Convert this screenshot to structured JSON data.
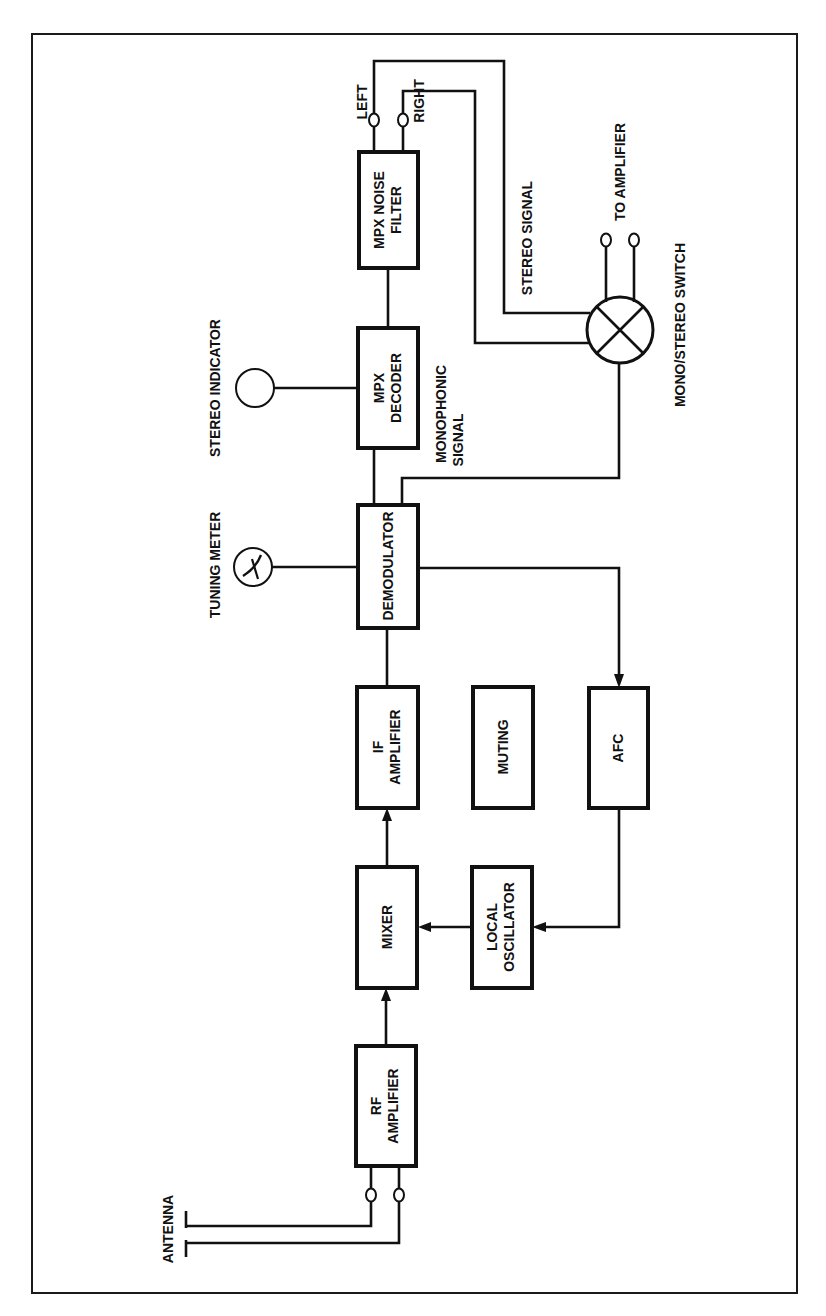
{
  "diagram": {
    "blocks": {
      "rf_amplifier": {
        "line1": "RF",
        "line2": "AMPLIFIER"
      },
      "mixer": {
        "line1": "MIXER"
      },
      "local_oscillator": {
        "line1": "LOCAL",
        "line2": "OSCILLATOR"
      },
      "if_amplifier": {
        "line1": "IF",
        "line2": "AMPLIFIER"
      },
      "muting": {
        "line1": "MUTING"
      },
      "afc": {
        "line1": "AFC"
      },
      "demodulator": {
        "line1": "DEMODULATOR"
      },
      "mpx_decoder": {
        "line1": "MPX",
        "line2": "DECODER"
      },
      "mpx_noise_filter": {
        "line1": "MPX NOISE",
        "line2": "FILTER"
      }
    },
    "labels": {
      "antenna": "ANTENNA",
      "tuning_meter": "TUNING METER",
      "stereo_indicator": "STEREO INDICATOR",
      "monophonic_line1": "MONOPHONIC",
      "monophonic_line2": "SIGNAL",
      "stereo_signal": "STEREO SIGNAL",
      "left": "LEFT",
      "right": "RIGHT",
      "to_amplifier": "TO AMPLIFIER",
      "mono_stereo_switch": "MONO/STEREO SWITCH"
    },
    "connections": [
      {
        "from": "antenna",
        "to": "rf_amplifier"
      },
      {
        "from": "rf_amplifier",
        "to": "mixer",
        "arrow": true
      },
      {
        "from": "local_oscillator",
        "to": "mixer",
        "arrow": true
      },
      {
        "from": "mixer",
        "to": "if_amplifier",
        "arrow": true
      },
      {
        "from": "if_amplifier",
        "to": "demodulator"
      },
      {
        "from": "demodulator",
        "to": "tuning_meter"
      },
      {
        "from": "demodulator",
        "to": "afc",
        "arrow": true
      },
      {
        "from": "afc",
        "to": "local_oscillator",
        "arrow": true
      },
      {
        "from": "demodulator",
        "to": "mpx_decoder"
      },
      {
        "from": "mpx_decoder",
        "to": "stereo_indicator"
      },
      {
        "from": "mpx_decoder",
        "to": "mpx_noise_filter"
      },
      {
        "from": "mpx_noise_filter",
        "to": "mono_stereo_switch",
        "label": "stereo signal (left/right)"
      },
      {
        "from": "demodulator",
        "to": "mono_stereo_switch",
        "label": "monophonic signal"
      },
      {
        "from": "mono_stereo_switch",
        "to": "to_amplifier"
      }
    ]
  }
}
